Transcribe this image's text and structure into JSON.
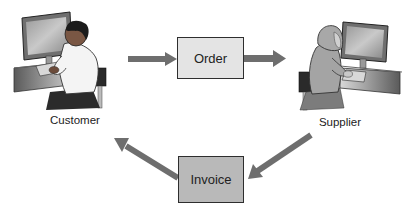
{
  "diagram": {
    "actors": {
      "customer": {
        "label": "Customer"
      },
      "supplier": {
        "label": "Supplier"
      }
    },
    "documents": {
      "order": {
        "label": "Order"
      },
      "invoice": {
        "label": "Invoice"
      }
    },
    "flows": [
      {
        "from": "Customer",
        "to": "Order"
      },
      {
        "from": "Order",
        "to": "Supplier"
      },
      {
        "from": "Supplier",
        "to": "Invoice"
      },
      {
        "from": "Invoice",
        "to": "Customer"
      }
    ],
    "colors": {
      "arrow": "#6e6e6e",
      "order_fill": "#e4e4e4",
      "invoice_fill": "#b9b9b9",
      "border": "#2e2e2e"
    }
  }
}
